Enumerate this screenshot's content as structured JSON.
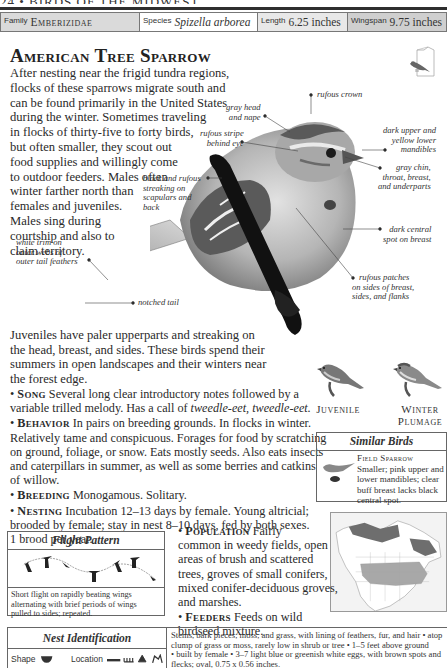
{
  "running_head": "24 • BIRDS OF THE MIDWEST",
  "info_bar": {
    "family_label": "Family",
    "family_value": "Emberizidae",
    "species_label": "Species",
    "species_value": "Spizella arborea",
    "length_label": "Length",
    "length_value": "6.25 inches",
    "wingspan_label": "Wingspan",
    "wingspan_value": "9.75 inches"
  },
  "title": "American Tree Sparrow",
  "intro_lines": [
    "After nesting near the frigid tundra regions,",
    "flocks of these sparrows migrate south and",
    "can be found primarily in the United States",
    "during the winter. Sometimes traveling",
    "in flocks of thirty-five to forty birds,",
    "but often smaller, they scout out",
    "food supplies and willingly come",
    "to outdoor feeders. Males often",
    "winter farther north than",
    "females and juveniles.",
    "Males sing during",
    "courtship and also to",
    "claim territory."
  ],
  "callouts": {
    "rufous_crown": [
      "rufous crown"
    ],
    "gray_head": [
      "gray head",
      "and nape"
    ],
    "rufous_stripe": [
      "rufous stripe",
      "behind eye"
    ],
    "mandibles": [
      "dark upper and",
      "yellow lower",
      "mandibles"
    ],
    "gray_chin": [
      "gray chin,",
      "throat, breast,",
      "and underparts"
    ],
    "black_rufous": [
      "black and rufous",
      "streaking on",
      "scapulars and",
      "back"
    ],
    "dark_spot": [
      "dark central",
      "spot on breast"
    ],
    "white_trim": [
      "white trim on",
      "outer webs of",
      "outer tail feathers"
    ],
    "rufous_patches": [
      "rufous patches",
      "on sides of breast,",
      "sides, and flanks"
    ],
    "notched_tail": [
      "notched tail"
    ]
  },
  "juvenile_lines": [
    "Juveniles have paler upperparts and streaking on",
    "the head, breast, and sides. These birds spend their",
    "summers in open landscapes and their winters near",
    "the forest edge."
  ],
  "facts": {
    "song": {
      "heading": "Song",
      "lines": [
        "Several long clear introductory notes followed by a",
        "variable trilled melody. Has a call of "
      ],
      "call": "tweedle-eet, tweedle-eet."
    },
    "behavior": {
      "heading": "Behavior",
      "lines": [
        "In pairs on breeding grounds. In flocks in winter.",
        "Relatively tame and conspicuous. Forages for food by scratching",
        "on ground, foliage, or snow. Eats mostly seeds. Also eats insects",
        "and caterpillars in summer, as well as some berries and catkins",
        "of willow."
      ]
    },
    "breeding": {
      "heading": "Breeding",
      "lines": [
        "Monogamous. Solitary."
      ]
    },
    "nesting": {
      "heading": "Nesting",
      "lines": [
        "Incubation 12–13 days by female. Young altricial;",
        "brooded by female; stay in nest 8–10 days, fed by both sexes.",
        "1 brood per year."
      ]
    }
  },
  "plumages": {
    "juvenile": "Juvenile",
    "winter_1": "Winter",
    "winter_2": "Plumage"
  },
  "similar_birds": {
    "heading": "Similar Birds",
    "name": "Field Sparrow",
    "lines": [
      "Smaller; pink upper and",
      "lower mandibles; clear",
      "buff breast lacks black",
      "central spot."
    ]
  },
  "flight_pattern": {
    "heading": "Flight Pattern",
    "caption": [
      "Short flight on rapidly beating wings",
      "alternating with brief periods of wings",
      "pulled to sides; repeated."
    ]
  },
  "population": {
    "heading": "Population",
    "lines": [
      "Fairly",
      "common in weedy fields, open",
      "areas of brush and scattered",
      "trees, groves of small conifers,",
      "mixed conifer-deciduous groves,",
      "and marshes."
    ]
  },
  "feeders": {
    "heading": "Feeders",
    "lines": [
      "Feeds on wild",
      "birdseed mixture."
    ]
  },
  "nest_id": {
    "heading": "Nest Identification",
    "shape_label": "Shape",
    "location_label": "Location",
    "lines": [
      "Stems, bark pieces, moss, and grass, with lining of feathers, fur, and hair • atop",
      "clump of grass or moss, rarely low in shrub or tree • 1–5 feet above ground",
      "• built by female • 3–7 light blue or greenish white eggs, with brown spots and",
      "flecks; oval, 0.75 x 0.56 inches."
    ]
  },
  "colors": {
    "family_bg": "#dadada",
    "length_bg": "#e8e8e8",
    "wingspan_bg": "#cfcfcf",
    "text": "#2a2a2a",
    "map_breeding": "#6e6e6e",
    "map_winter": "#a8a8a8"
  }
}
